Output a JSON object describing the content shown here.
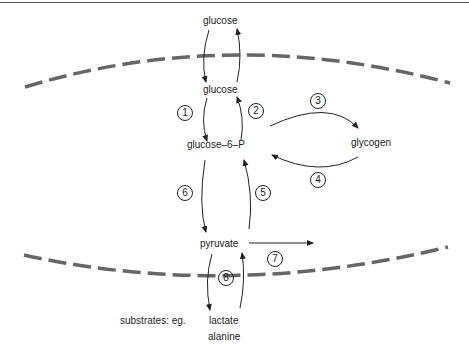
{
  "diagram": {
    "nodes": {
      "glucose_outside": "glucose",
      "glucose_inside": "glucose",
      "glucose_6_p": "glucose–6–P",
      "glycogen": "glycogen",
      "pyruvate": "pyruvate",
      "substrates_prefix": "substrates: eg.",
      "lactate": "lactate",
      "alanine": "alanine"
    },
    "steps": [
      "1",
      "2",
      "3",
      "4",
      "5",
      "6",
      "7",
      "8"
    ],
    "membranes": [
      "cell-membrane-top",
      "cell-membrane-bottom"
    ],
    "colors": {
      "membrane": "#666666",
      "ink": "#222222"
    }
  }
}
